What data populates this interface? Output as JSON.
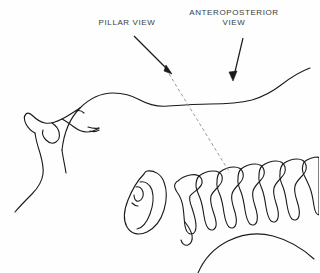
{
  "figure": {
    "background_color": "#fefefe",
    "line_color": "#1a1a1a",
    "text_color": "#3a3a3a",
    "dashed_line_color": "#9a9a9a",
    "width": 319,
    "height": 273
  },
  "annotations": [
    {
      "id": "pillar",
      "label": "PILLAR VIEW",
      "label_lines": [
        "PILLAR VIEW"
      ],
      "arrow": {
        "from_x": 134,
        "from_y": 36,
        "to_x": 172,
        "to_y": 74
      }
    },
    {
      "id": "anteroposterior",
      "label": "ANTEROPOSTERIOR VIEW",
      "label_lines": [
        "ANTEROPOSTERIOR",
        "VIEW"
      ],
      "arrow": {
        "from_x": 243,
        "from_y": 38,
        "to_x": 233,
        "to_y": 80
      }
    }
  ],
  "projection_line": {
    "name": "pillar-projection-axis",
    "style": "dashed",
    "from_x": 166,
    "from_y": 69,
    "to_x": 230,
    "to_y": 173
  },
  "anatomy": {
    "parts": [
      {
        "name": "face-profile",
        "label": "Face profile (forehead, nose, lips, chin)"
      },
      {
        "name": "cranium-outline",
        "label": "Cranium and skull base outline"
      },
      {
        "name": "ear",
        "label": "External ear (auricle)"
      },
      {
        "name": "cervical-vertebrae",
        "label": "Cervical vertebrae",
        "count": 7
      },
      {
        "name": "shoulder-contour",
        "label": "Shoulder contour"
      },
      {
        "name": "neck-contour",
        "label": "Anterior neck and jaw contour"
      }
    ]
  }
}
